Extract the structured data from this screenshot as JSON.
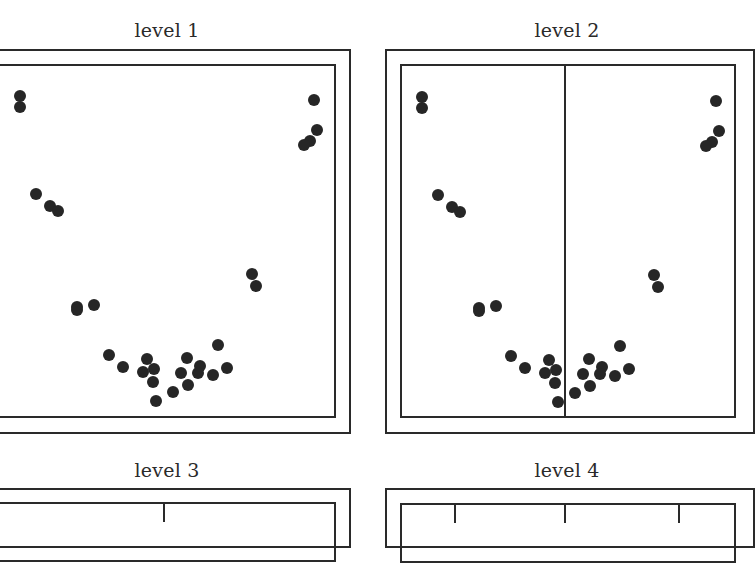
{
  "panels": [
    {
      "title": "level 1",
      "splits": []
    },
    {
      "title": "level 2",
      "splits": [
        565
      ]
    },
    {
      "title": "level 3",
      "splits": [
        164
      ]
    },
    {
      "title": "level 4",
      "splits": [
        455,
        565,
        679
      ]
    }
  ],
  "colors": {
    "ink": "#2a2a2a",
    "point": "#262626",
    "background": "#ffffff"
  },
  "points": [
    [
      20,
      96
    ],
    [
      20,
      107
    ],
    [
      314,
      100
    ],
    [
      317,
      130
    ],
    [
      310,
      141
    ],
    [
      304,
      145
    ],
    [
      36,
      194
    ],
    [
      50,
      206
    ],
    [
      58,
      211
    ],
    [
      77,
      307
    ],
    [
      77,
      310
    ],
    [
      94,
      305
    ],
    [
      252,
      274
    ],
    [
      256,
      286
    ],
    [
      109,
      355
    ],
    [
      123,
      367
    ],
    [
      147,
      359
    ],
    [
      143,
      372
    ],
    [
      154,
      369
    ],
    [
      153,
      382
    ],
    [
      156,
      401
    ],
    [
      173,
      392
    ],
    [
      181,
      373
    ],
    [
      188,
      385
    ],
    [
      187,
      358
    ],
    [
      200,
      366
    ],
    [
      198,
      373
    ],
    [
      213,
      375
    ],
    [
      218,
      345
    ],
    [
      227,
      368
    ]
  ]
}
